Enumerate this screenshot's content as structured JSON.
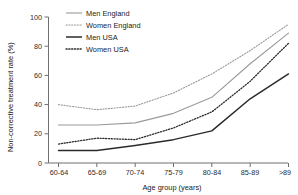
{
  "chart_data": {
    "type": "line",
    "title": "",
    "xlabel": "Age group (years)",
    "ylabel": "Non-corrective treatment rate (%)",
    "categories": [
      "60-64",
      "65-69",
      "70-74",
      "75-79",
      "80-84",
      "85-89",
      ">89"
    ],
    "xlim": [
      0,
      6
    ],
    "ylim": [
      0,
      100
    ],
    "yticks": [
      0,
      20,
      40,
      60,
      80,
      100
    ],
    "ytick_labels": [
      "0",
      "20",
      "40",
      "60",
      "80",
      "100"
    ],
    "grid": false,
    "legend_position": "top-left",
    "series": [
      {
        "name": "Men England",
        "color": "#9a9a9a",
        "style": "solid",
        "values": [
          26,
          26,
          27.5,
          34,
          45,
          68,
          89
        ]
      },
      {
        "name": "Women England",
        "color": "#9a9a9a",
        "style": "dotted",
        "values": [
          40,
          36.5,
          39,
          48,
          61,
          77,
          95
        ]
      },
      {
        "name": "Men USA",
        "color": "#2b2b2b",
        "style": "solid",
        "values": [
          8.5,
          8.5,
          12,
          16,
          22,
          44,
          61
        ]
      },
      {
        "name": "Women USA",
        "color": "#2b2b2b",
        "style": "dotted",
        "values": [
          13,
          17,
          16,
          24,
          35,
          56,
          82
        ]
      }
    ]
  },
  "legend": {
    "items": [
      {
        "label": "Men England"
      },
      {
        "label": "Women England"
      },
      {
        "label": "Men USA"
      },
      {
        "label": "Women USA"
      }
    ]
  },
  "axes": {
    "y_title": "Non-corrective treatment rate (%)",
    "x_title": "Age group (years)",
    "y_tick_0": "0",
    "y_tick_1": "20",
    "y_tick_2": "40",
    "y_tick_3": "60",
    "y_tick_4": "80",
    "y_tick_5": "100",
    "x_tick_0": "60-64",
    "x_tick_1": "65-69",
    "x_tick_2": "70-74",
    "x_tick_3": "75-79",
    "x_tick_4": "80-84",
    "x_tick_5": "85-89",
    "x_tick_6": ">89"
  }
}
